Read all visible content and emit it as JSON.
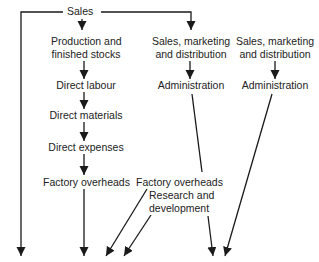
{
  "diagram": {
    "root": "Sales",
    "columns": [
      {
        "name": "production",
        "nodes": [
          "Production and",
          "finished stocks",
          "Direct labour",
          "Direct materials",
          "Direct expenses",
          "Factory overheads"
        ]
      },
      {
        "name": "sales-marketing-1",
        "nodes": [
          "Sales, marketing",
          "and distribution",
          "Administration",
          "Factory overheads",
          "Research and",
          "development"
        ]
      },
      {
        "name": "sales-marketing-2",
        "nodes": [
          "Sales, marketing",
          "and distribution",
          "Administration"
        ]
      }
    ],
    "line_color": "#1a1a1a"
  }
}
